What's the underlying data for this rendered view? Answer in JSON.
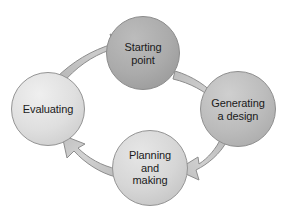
{
  "diagram": {
    "type": "cycle-diagram",
    "background_color": "#ffffff",
    "text_color": "#1a1a1a",
    "arrow_fill": "#c6c6c6",
    "arrow_stroke": "#8a8a8a",
    "nodes": [
      {
        "id": "starting-point",
        "label": "Starting\npoint",
        "cx": 143,
        "cy": 53,
        "r": 36.5,
        "fill": "#a8a8a8",
        "fill_light": "#bcbcbc",
        "fill_dark": "#9a9a9a",
        "stroke": "#8c8c8c"
      },
      {
        "id": "generating-a-design",
        "label": "Generating\na design",
        "cx": 238,
        "cy": 109,
        "r": 37.5,
        "fill": "#b9b9b9",
        "fill_light": "#cdcdcd",
        "fill_dark": "#ababab",
        "stroke": "#8f8f8f"
      },
      {
        "id": "planning-and-making",
        "label": "Planning\nand\nmaking",
        "cx": 150,
        "cy": 168,
        "r": 37.5,
        "fill": "#d3d3d3",
        "fill_light": "#e4e4e4",
        "fill_dark": "#c4c4c4",
        "stroke": "#949494"
      },
      {
        "id": "evaluating",
        "label": "Evaluating",
        "cx": 48,
        "cy": 109,
        "r": 36.5,
        "fill": "#dcdcdc",
        "fill_light": "#ededed",
        "fill_dark": "#cdcdcd",
        "stroke": "#949494"
      }
    ],
    "arrows": [
      {
        "id": "evaluating-to-starting-point",
        "from": "evaluating",
        "to": "starting-point",
        "direction": "clockwise"
      },
      {
        "id": "starting-point-to-generating",
        "from": "starting-point",
        "to": "generating-a-design",
        "direction": "clockwise"
      },
      {
        "id": "generating-to-planning",
        "from": "generating-a-design",
        "to": "planning-and-making",
        "direction": "clockwise"
      },
      {
        "id": "planning-to-evaluating",
        "from": "planning-and-making",
        "to": "evaluating",
        "direction": "clockwise"
      }
    ]
  }
}
